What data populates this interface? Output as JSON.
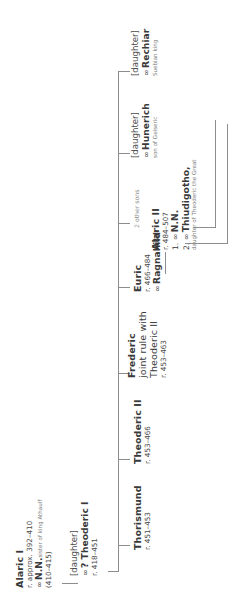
{
  "diagram": {
    "orientation": "rotated-90-ccw",
    "line_color": "#8d8d8d",
    "text_color": "#3b3b3b",
    "muted_color": "#7b7b7b",
    "marriage_symbol": "∞"
  },
  "nodes": {
    "alaric_i": {
      "name": "Alaric I",
      "reign": "r. approx. 392–410",
      "spouse": "N.N.",
      "spouse_note": "sister of king Athaulf",
      "spouse_dates": "(410–415)"
    },
    "daughter_theoderic_i": {
      "label": "[daughter]",
      "spouse": "? Theoderic I",
      "reign": "r. 418–451"
    },
    "thorismund": {
      "name": "Thorismund",
      "reign": "r. 451–453"
    },
    "theoderic_ii": {
      "name": "Theoderic II",
      "reign": "r. 453–466"
    },
    "frederic": {
      "name": "Frederic",
      "note_line1": "joint rule with",
      "note_line2": "Theoderic II",
      "reign": "r. 453–463"
    },
    "euric": {
      "name": "Euric",
      "reign": "r. 466–484",
      "spouse": "Ragnahild"
    },
    "other_sons": {
      "label": "2 other sons"
    },
    "daughter_hunerich": {
      "label": "[daughter]",
      "spouse": "Hunerich",
      "spouse_note": "son of Geiseric"
    },
    "daughter_rechiar": {
      "label": "[daughter]",
      "spouse": "Rechiar",
      "spouse_note": "Suebian king"
    },
    "alaric_ii": {
      "name": "Alaric II",
      "reign": "r. 484–507",
      "marriage1_index": "1.",
      "marriage1_spouse": "N.N.",
      "marriage2_index": "2.",
      "marriage2_spouse": "Thiudigotho,",
      "marriage2_note": "daughter of Theoderic the Great"
    }
  }
}
